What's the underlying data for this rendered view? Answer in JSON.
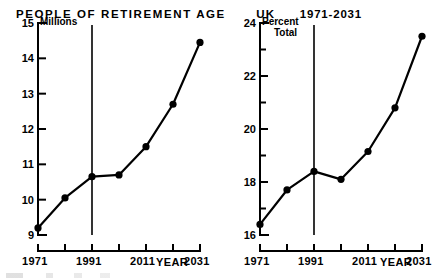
{
  "title": {
    "main": "PEOPLE OF RETIREMENT AGE",
    "region": "UK",
    "range": "1971-2031"
  },
  "chart_data": [
    {
      "type": "line",
      "id": "people-of-retirement-age-millions",
      "title": "PEOPLE OF RETIREMENT AGE",
      "subtitle": "UK 1971-2031",
      "ylabel": "Millions",
      "xlabel": "YEAR",
      "x": [
        1971,
        1981,
        1991,
        2001,
        2011,
        2021,
        2031
      ],
      "values": [
        9.2,
        10.05,
        10.65,
        10.7,
        11.5,
        12.7,
        14.45
      ],
      "xlim": [
        1971,
        2031
      ],
      "ylim": [
        9,
        15
      ],
      "ytick_labels": [
        "9",
        "10",
        "11",
        "12",
        "13",
        "14",
        "15"
      ],
      "ytick_values": [
        9,
        10,
        11,
        12,
        13,
        14,
        15
      ],
      "xtick_values": [
        1971,
        1981,
        1991,
        2001,
        2011,
        2021,
        2031
      ],
      "xtick_labels": [
        "1971",
        "",
        "1991",
        "",
        "2011",
        "",
        "2031"
      ],
      "annotation_line_x": 1991,
      "grid": false,
      "legend": "none",
      "marker": "filled-circle",
      "color": "#000000"
    },
    {
      "type": "line",
      "id": "people-of-retirement-age-percent-total",
      "title": "PEOPLE OF RETIREMENT AGE",
      "subtitle": "UK 1971-2031",
      "ylabel": "Percent Total",
      "ylabel_lines": [
        "Percent",
        "Total"
      ],
      "xlabel": "YEAR",
      "x": [
        1971,
        1981,
        1991,
        2001,
        2011,
        2021,
        2031
      ],
      "values": [
        16.4,
        17.7,
        18.4,
        18.1,
        19.15,
        20.8,
        23.5
      ],
      "xlim": [
        1971,
        2031
      ],
      "ylim": [
        16,
        24
      ],
      "ytick_labels": [
        "16",
        "",
        "18",
        "",
        "20",
        "",
        "22",
        "",
        "24"
      ],
      "ytick_values": [
        16,
        17,
        18,
        19,
        20,
        21,
        22,
        23,
        24
      ],
      "ytick_major": [
        16,
        18,
        20,
        22,
        24
      ],
      "xtick_values": [
        1971,
        1981,
        1991,
        2001,
        2011,
        2021,
        2031
      ],
      "xtick_labels": [
        "1971",
        "",
        "1991",
        "",
        "2011",
        "",
        "2031"
      ],
      "annotation_line_x": 1991,
      "grid": false,
      "legend": "none",
      "marker": "filled-circle",
      "color": "#000000"
    }
  ]
}
